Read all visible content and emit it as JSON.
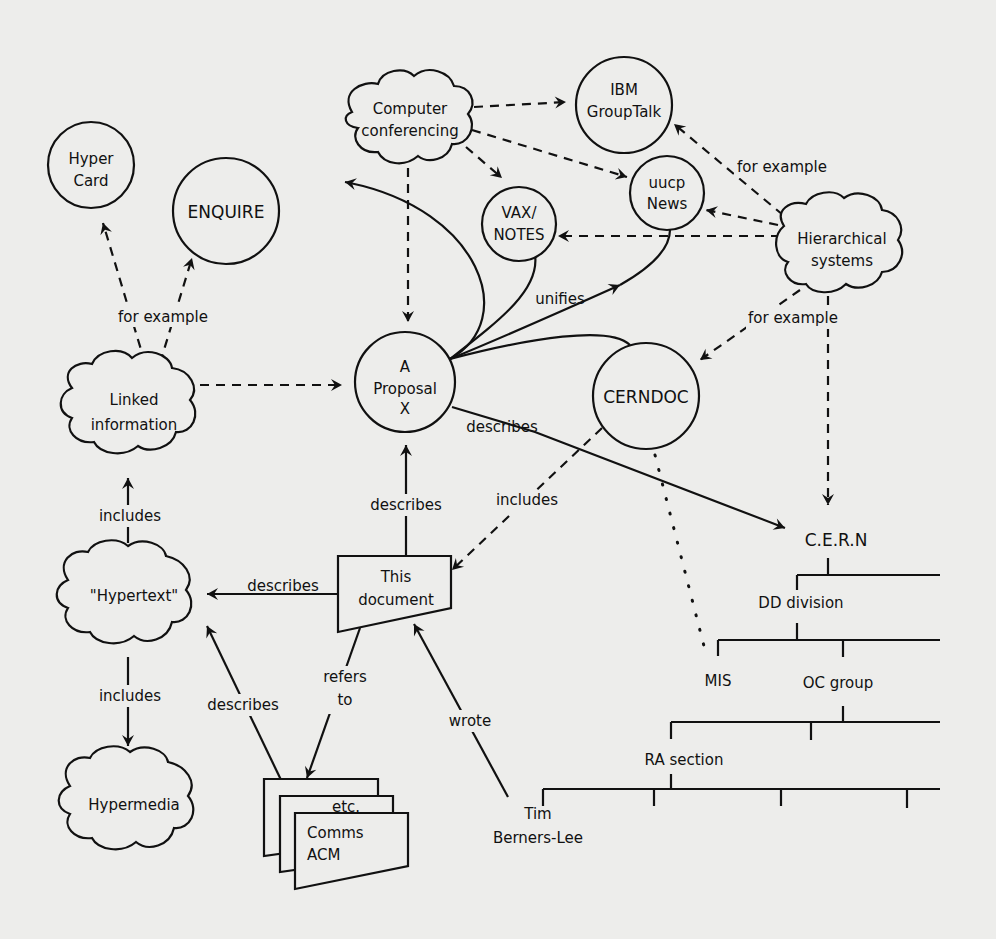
{
  "diagram": {
    "nodes": {
      "hypercard": [
        "Hyper",
        "Card"
      ],
      "enquire": [
        "ENQUIRE"
      ],
      "computer_conferencing": [
        "Computer",
        "conferencing"
      ],
      "ibm_grouptalk": [
        "IBM",
        "GroupTalk"
      ],
      "uucp_news": [
        "uucp",
        "News"
      ],
      "vax_notes": [
        "VAX/",
        "NOTES"
      ],
      "hierarchical_systems": [
        "Hierarchical",
        "systems"
      ],
      "linked_information": [
        "Linked",
        "information"
      ],
      "proposal": [
        "A",
        "Proposal",
        "X"
      ],
      "cerndoc": [
        "CERNDOC"
      ],
      "hypertext": [
        "\"Hypertext\""
      ],
      "this_document": [
        "This",
        "document"
      ],
      "hypermedia": [
        "Hypermedia"
      ],
      "comms_acm": [
        "Comms",
        "ACM"
      ],
      "etc": "etc.",
      "tim": [
        "Tim",
        "Berners-Lee"
      ]
    },
    "edge_labels": {
      "for_example_left": "for example",
      "for_example_top_right": "for example",
      "for_example_right": "for example",
      "unifies": "unifies",
      "describes_proposal_cern": "describes",
      "includes_cerndoc": "includes",
      "describes_doc_proposal": "describes",
      "describes_doc_hypertext": "describes",
      "includes_hypertext_linked": "includes",
      "includes_hypertext_hypermedia": "includes",
      "describes_comms_hypertext": "describes",
      "refers_to": [
        "refers",
        "to"
      ],
      "wrote": "wrote"
    },
    "org_chart": {
      "root": "C.E.R.N",
      "division": "DD division",
      "mis": "MIS",
      "group": "OC group",
      "section": "RA section"
    }
  }
}
